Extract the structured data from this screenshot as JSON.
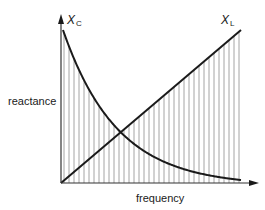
{
  "diagram": {
    "type": "reactance-vs-frequency",
    "title": "",
    "axes": {
      "x_label": "frequency",
      "y_label": "reactance",
      "origin": [
        61,
        183
      ],
      "x_arrow_tip": [
        259,
        183
      ],
      "y_arrow_tip": [
        61,
        14
      ]
    },
    "curves": [
      {
        "id": "XC",
        "symbol": "X",
        "subscript": "C",
        "shape": "decreasing-hyperbola",
        "label_pos": [
          67,
          14
        ]
      },
      {
        "id": "XL",
        "symbol": "X",
        "subscript": "L",
        "shape": "increasing-line",
        "label_pos": [
          221,
          14
        ]
      }
    ],
    "intersection": [
      118,
      133
    ],
    "hatching": {
      "orientation": "vertical",
      "x_start": 64,
      "x_end": 241,
      "spacing": 5,
      "fill": "below max(XC, XL)"
    },
    "colors": {
      "curve": "#1a1a1a",
      "axis": "#333333",
      "hatch": "#9a9a9a",
      "background": "#ffffff"
    }
  }
}
